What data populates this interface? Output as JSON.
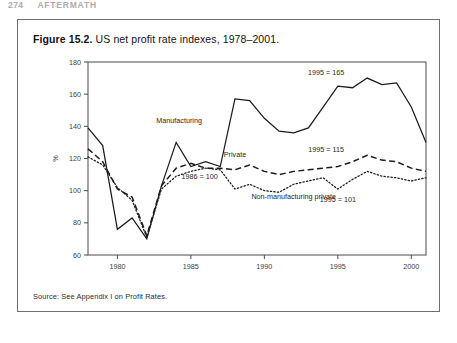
{
  "page_header": {
    "page_number": "274",
    "running_title": "AFTERMATH"
  },
  "figure": {
    "caption_number": "Figure 15.2.",
    "caption_text": " US net profit rate indexes, 1978–2001.",
    "source_note": "Source: See Appendix I on Profit Rates."
  },
  "chart_data": {
    "type": "line",
    "title": "US net profit rate indexes, 1978–2001",
    "xlabel": "",
    "ylabel": "%",
    "xlim": [
      1978,
      2001
    ],
    "ylim": [
      60,
      180
    ],
    "grid": false,
    "legend_position": "inline-labels",
    "xticks": [
      "1980",
      "1985",
      "1990",
      "1995",
      "2000"
    ],
    "xtick_values": [
      1980,
      1985,
      1990,
      1995,
      2000
    ],
    "yticks": [
      "60",
      "80",
      "100",
      "120",
      "140",
      "160",
      "180"
    ],
    "ytick_values": [
      60,
      80,
      100,
      120,
      140,
      160,
      180
    ],
    "x": [
      1978,
      1979,
      1980,
      1981,
      1982,
      1983,
      1984,
      1985,
      1986,
      1987,
      1988,
      1989,
      1990,
      1991,
      1992,
      1993,
      1994,
      1995,
      1996,
      1997,
      1998,
      1999,
      2000,
      2001
    ],
    "series": [
      {
        "name": "Manufacturing",
        "style": "solid",
        "values": [
          139,
          128,
          76,
          83,
          70,
          103,
          130,
          115,
          118,
          115,
          157,
          156,
          145,
          137,
          136,
          139,
          152,
          165,
          164,
          170,
          166,
          167,
          152,
          130
        ]
      },
      {
        "name": "Private",
        "style": "dashed",
        "values": [
          126,
          118,
          101,
          96,
          72,
          103,
          114,
          117,
          114,
          114,
          113,
          116,
          112,
          110,
          112,
          113,
          114,
          115,
          118,
          122,
          119,
          118,
          114,
          112
        ]
      },
      {
        "name": "Non-manufacturing private",
        "style": "dotted",
        "values": [
          121,
          116,
          102,
          94,
          71,
          101,
          109,
          112,
          114,
          113,
          101,
          104,
          100,
          99,
          104,
          106,
          108,
          101,
          107,
          112,
          109,
          108,
          106,
          108
        ]
      }
    ],
    "annotations": [
      {
        "text": "Manufacturing",
        "series": "Manufacturing"
      },
      {
        "text": "Private",
        "series": "Private"
      },
      {
        "text": "Non-manufacturing private",
        "series": "Non-manufacturing private"
      },
      {
        "text": "1986 = 100",
        "series": "baseline"
      },
      {
        "text": "1995 = 165",
        "series": "Manufacturing"
      },
      {
        "text": "1995 = 115",
        "series": "Private"
      },
      {
        "text": "1995 = 101",
        "series": "Non-manufacturing private"
      }
    ]
  }
}
